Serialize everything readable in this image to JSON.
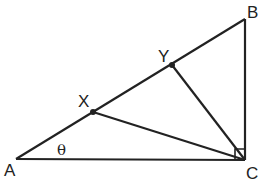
{
  "diagram": {
    "type": "geometry-right-triangle",
    "stroke_color": "#222222",
    "background": "#ffffff",
    "vertices": {
      "A": {
        "label": "A",
        "x": 16,
        "y": 159
      },
      "B": {
        "label": "B",
        "x": 245,
        "y": 19
      },
      "C": {
        "label": "C",
        "x": 245,
        "y": 160
      }
    },
    "points": {
      "X": {
        "label": "X",
        "x": 93,
        "y": 112
      },
      "Y": {
        "label": "Y",
        "x": 172,
        "y": 65
      }
    },
    "angle_label": "θ",
    "right_angle_at": "C",
    "segments": [
      "AB",
      "BC",
      "CA",
      "XC",
      "YC"
    ]
  }
}
